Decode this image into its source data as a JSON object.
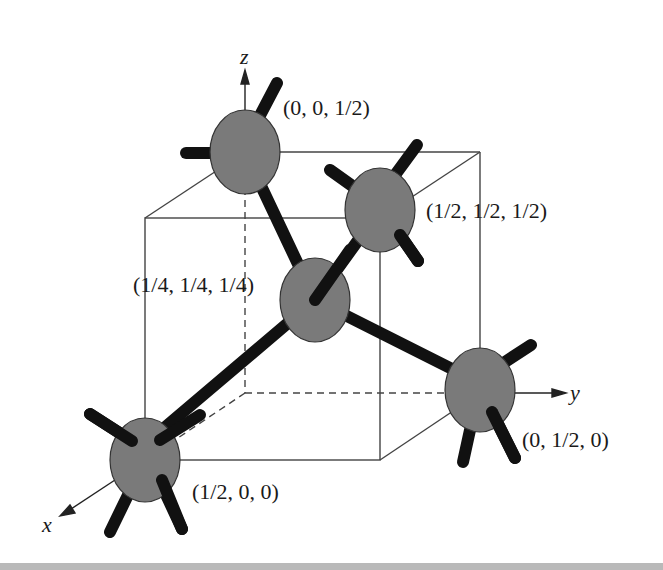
{
  "diagram": {
    "colors": {
      "atom_fill": "#7a7a7a",
      "atom_stroke": "#333333",
      "bond": "#111111",
      "cube_line": "#444444",
      "background": "#ffffff"
    },
    "axes": [
      {
        "name": "x",
        "label": "x"
      },
      {
        "name": "y",
        "label": "y"
      },
      {
        "name": "z",
        "label": "z"
      }
    ],
    "atoms": [
      {
        "id": "center",
        "label": "(1/4, 1/4, 1/4)"
      },
      {
        "id": "top",
        "label": "(0, 0, 1/2)"
      },
      {
        "id": "back-top",
        "label": "(1/2, 1/2, 1/2)"
      },
      {
        "id": "right",
        "label": "(0, 1/2, 0)"
      },
      {
        "id": "front-left",
        "label": "(1/2, 0, 0)"
      }
    ]
  }
}
